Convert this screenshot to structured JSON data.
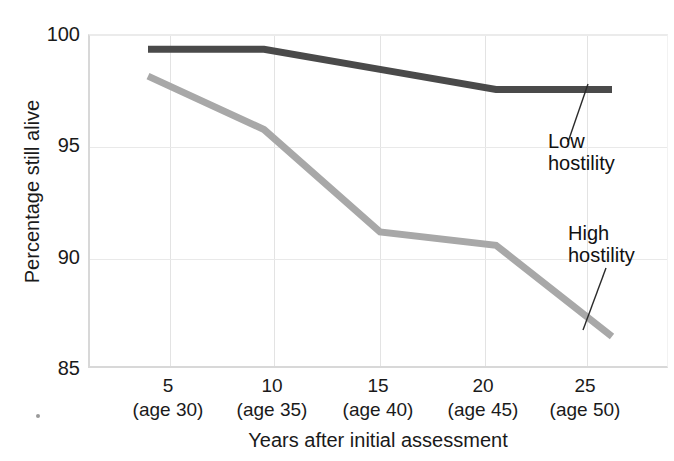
{
  "chart_data": {
    "type": "line",
    "title": "",
    "xlabel": "Years after initial assessment",
    "ylabel": "Percentage still alive",
    "x": [
      5,
      10,
      15,
      20,
      25
    ],
    "categories": [
      "5",
      "10",
      "15",
      "20",
      "25"
    ],
    "xtick_sublabels": [
      "(age 30)",
      "(age 35)",
      "(age 40)",
      "(age 45)",
      "(age 50)"
    ],
    "xlim": [
      2.5,
      27.5
    ],
    "ylim": [
      85,
      100
    ],
    "yticks": [
      85,
      90,
      95,
      100
    ],
    "ytick_labels": [
      "85",
      "90",
      "95",
      "100"
    ],
    "grid": true,
    "legend_position": "inline-annotations",
    "series": [
      {
        "name": "Low hostility",
        "color": "#4a4a4a",
        "values": [
          99.4,
          99.4,
          98.5,
          97.6,
          97.6
        ]
      },
      {
        "name": "High hostility",
        "color": "#a8a8a8",
        "values": [
          98.2,
          95.8,
          91.2,
          90.6,
          86.5
        ]
      }
    ],
    "annotations": [
      {
        "text_line1": "Low",
        "text_line2": "hostility",
        "target_series": "Low hostility"
      },
      {
        "text_line1": "High",
        "text_line2": "hostility",
        "target_series": "High hostility"
      }
    ]
  },
  "axes": {
    "y_ticks": [
      {
        "label": "100",
        "value": 100
      },
      {
        "label": "95",
        "value": 95
      },
      {
        "label": "90",
        "value": 90
      },
      {
        "label": "85",
        "value": 85
      }
    ],
    "x_ticks": [
      {
        "num": "5",
        "age": "(age 30)"
      },
      {
        "num": "10",
        "age": "(age 35)"
      },
      {
        "num": "15",
        "age": "(age 40)"
      },
      {
        "num": "20",
        "age": "(age 45)"
      },
      {
        "num": "25",
        "age": "(age 50)"
      }
    ],
    "x_title": "Years after initial assessment",
    "y_title": "Percentage still alive"
  },
  "annotations": {
    "low": {
      "line1": "Low",
      "line2": "hostility"
    },
    "high": {
      "line1": "High",
      "line2": "hostility"
    }
  },
  "colors": {
    "low_hostility_line": "#4a4a4a",
    "high_hostility_line": "#a8a8a8",
    "grid": "#e6e6e6",
    "axis": "#d8d8d8",
    "text": "#1a1a1a",
    "background": "#ffffff"
  }
}
